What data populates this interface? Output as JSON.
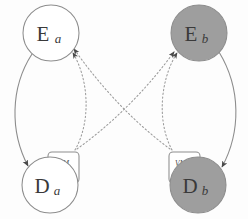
{
  "diagram": {
    "colors": {
      "background": "#fdfdfd",
      "stroke": "#8d8d8d",
      "node_fill_light": "#ffffff",
      "node_fill_dark": "#9e9e9e",
      "text": "#3a3a3a",
      "dotted_stroke": "#9a9a9a",
      "arrow_fill": "#4a4a4a"
    },
    "nodes": [
      {
        "id": "e-a",
        "name": "execution-node-a",
        "base": "E",
        "subscript": "a",
        "shape": "circle",
        "fill": "light",
        "cx": 51,
        "cy": 33,
        "r": 28
      },
      {
        "id": "e-b",
        "name": "execution-node-b",
        "base": "E",
        "subscript": "b",
        "shape": "circle",
        "fill": "dark",
        "cx": 199,
        "cy": 33,
        "r": 28
      },
      {
        "id": "d-a",
        "name": "data-node-a",
        "base": "D",
        "subscript": "a",
        "shape": "circle",
        "fill": "light",
        "cx": 50,
        "cy": 185,
        "r": 28
      },
      {
        "id": "d-b",
        "name": "data-node-b",
        "base": "D",
        "subscript": "b",
        "shape": "circle",
        "fill": "dark",
        "cx": 198,
        "cy": 185,
        "r": 28
      }
    ],
    "vm_boxes": [
      {
        "id": "vm-a",
        "name": "vm-box-a",
        "label": "VM",
        "x": 48,
        "y": 152,
        "width": 31,
        "height": 31,
        "side": "left"
      },
      {
        "id": "vm-b",
        "name": "vm-box-b",
        "label": "VM",
        "x": 169,
        "y": 152,
        "width": 31,
        "height": 31,
        "side": "right"
      }
    ],
    "edges": [
      {
        "id": "edge-ea-da",
        "name": "edge-execution-a-to-data-a",
        "style": "solid",
        "from": "e-a",
        "to": "d-a",
        "label": ""
      },
      {
        "id": "edge-eb-db",
        "name": "edge-execution-b-to-data-b",
        "style": "solid",
        "from": "e-b",
        "to": "d-b",
        "label": ""
      },
      {
        "id": "edge-vma-ea",
        "name": "edge-vm-a-to-execution-a",
        "style": "dotted",
        "from": "vm-a",
        "to": "e-a",
        "label": ""
      },
      {
        "id": "edge-vma-eb",
        "name": "edge-vm-a-to-execution-b",
        "style": "dotted",
        "from": "vm-a",
        "to": "e-b",
        "label": ""
      },
      {
        "id": "edge-vmb-eb",
        "name": "edge-vm-b-to-execution-b",
        "style": "dotted",
        "from": "vm-b",
        "to": "e-b",
        "label": ""
      },
      {
        "id": "edge-vmb-ea",
        "name": "edge-vm-b-to-execution-a",
        "style": "dotted",
        "from": "vm-b",
        "to": "e-a",
        "label": ""
      }
    ]
  }
}
